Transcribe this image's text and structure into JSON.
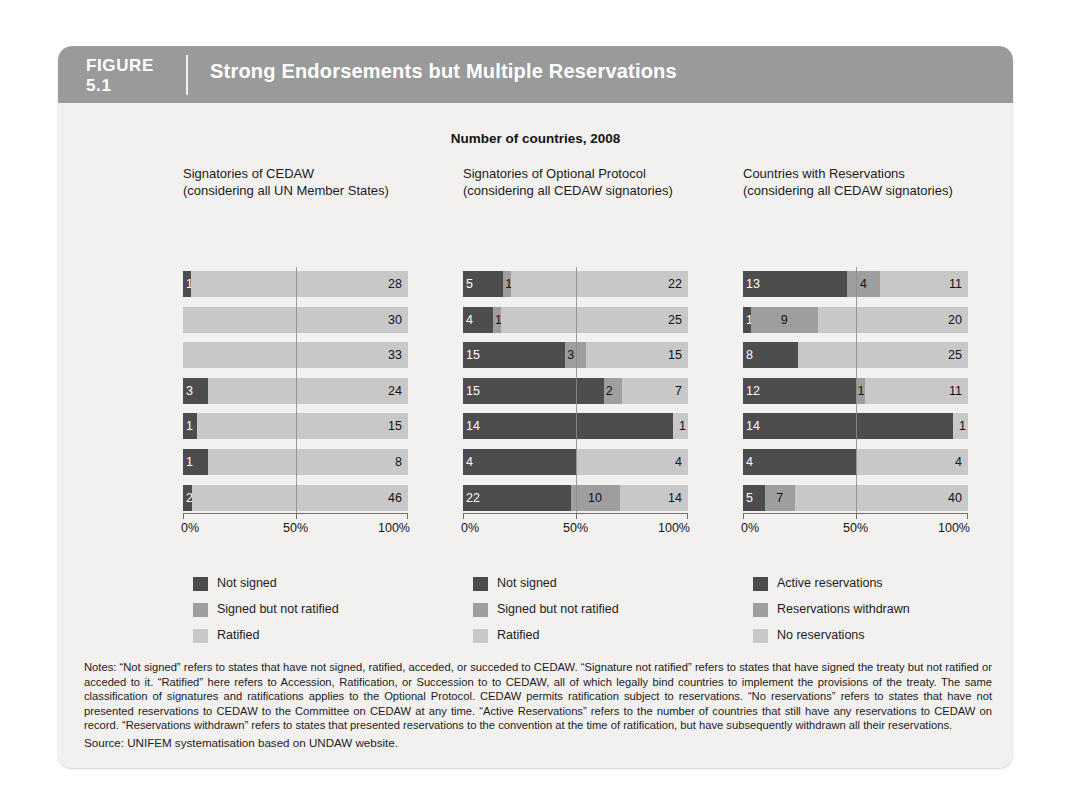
{
  "figure": {
    "label_word": "FIGURE",
    "number": "5.1",
    "title": "Strong Endorsements but Multiple Reservations"
  },
  "chart_data": {
    "type": "bar",
    "orientation": "horizontal",
    "stacked": true,
    "normalized": true,
    "title": "Number of countries, 2008",
    "xlabel": "",
    "ylabel": "",
    "xlim": [
      0,
      100
    ],
    "xticks": [
      "0%",
      "50%",
      "100%"
    ],
    "grid": false,
    "legend_position": "below",
    "categories": [
      "Developed Regions",
      "CEE/CIS",
      "Latin America Caribbean",
      "East Asia & Pacific",
      "Middle East & North Africa",
      "South Asia",
      "Sub-Saharan Africa"
    ],
    "panels": [
      {
        "title_line1": "Signatories of CEDAW",
        "title_line2": "(considering all UN Member States)",
        "legend": [
          "Not signed",
          "Signed but not ratified",
          "Ratified"
        ],
        "series": [
          {
            "name": "Not signed",
            "values": [
              1,
              0,
              0,
              3,
              1,
              1,
              2
            ]
          },
          {
            "name": "Signed but not ratified",
            "values": [
              0,
              0,
              0,
              0,
              0,
              0,
              0
            ]
          },
          {
            "name": "Ratified",
            "values": [
              28,
              30,
              33,
              24,
              15,
              8,
              46
            ]
          }
        ]
      },
      {
        "title_line1": "Signatories of Optional Protocol",
        "title_line2": "(considering all CEDAW signatories)",
        "legend": [
          "Not signed",
          "Signed but not ratified",
          "Ratified"
        ],
        "series": [
          {
            "name": "Not signed",
            "values": [
              5,
              4,
              15,
              15,
              14,
              4,
              22
            ]
          },
          {
            "name": "Signed but not ratified",
            "values": [
              1,
              1,
              3,
              2,
              0,
              0,
              10
            ]
          },
          {
            "name": "Ratified",
            "values": [
              22,
              25,
              15,
              7,
              1,
              4,
              14
            ]
          }
        ]
      },
      {
        "title_line1": "Countries with Reservations",
        "title_line2": "(considering all CEDAW signatories)",
        "legend": [
          "Active reservations",
          "Reservations withdrawn",
          "No reservations"
        ],
        "series": [
          {
            "name": "Active reservations",
            "values": [
              13,
              1,
              8,
              12,
              14,
              4,
              5
            ]
          },
          {
            "name": "Reservations withdrawn",
            "values": [
              4,
              9,
              0,
              1,
              0,
              0,
              7
            ]
          },
          {
            "name": "No reservations",
            "values": [
              11,
              20,
              25,
              11,
              1,
              4,
              40
            ]
          }
        ]
      }
    ],
    "colors": {
      "series1": "#4d4d4d",
      "series2": "#9e9e9e",
      "series3": "#c8c8c8"
    }
  },
  "notes": "Notes: “Not signed” refers to states that have not signed, ratified, acceded, or succeded to CEDAW. “Signature not ratified” refers to states that have signed the treaty but not ratified or acceded to it. “Ratified” here refers to Accession, Ratification, or Succession to to CEDAW, all of which legally bind countries to implement the provisions of the treaty. The same classification of signatures and ratifications applies to the Optional Protocol. CEDAW permits ratification subject to reservations. “No reservations” refers to states that have not presented reservations to CEDAW to the Committee on CEDAW at any time. “Active Reservations” refers to the number of countries that still have any reservations to CEDAW on record. “Reservations withdrawn” refers to states that presented reservations to the convention at the time of ratification, but have subsequently withdrawn all their reservations.",
  "source": "Source: UNIFEM systematisation based on UNDAW website."
}
